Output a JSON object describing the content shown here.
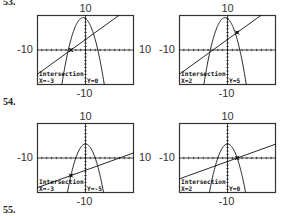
{
  "problems": {
    "top_label": "53.",
    "mid_label": "54.",
    "bottom_label": "55."
  },
  "window": {
    "xmin": -10,
    "xmax": 10,
    "ymin": -10,
    "ymax": 10,
    "labels": {
      "top": "10",
      "bottom": "-10",
      "left": "-10",
      "right": "10"
    }
  },
  "panels": [
    {
      "problem": "53",
      "curves": {
        "parabola": {
          "a": -1,
          "h": -0.5,
          "k": 9.25
        },
        "line": {
          "m": 1,
          "b": 3
        }
      },
      "intersection": {
        "x": -3,
        "y": 0
      },
      "readout": {
        "title": "Intersection",
        "x_text": "X=-3",
        "y_text": "Y=0"
      },
      "show_right_label": true
    },
    {
      "problem": "53",
      "curves": {
        "parabola": {
          "a": -1,
          "h": -0.5,
          "k": 9.25
        },
        "line": {
          "m": 1,
          "b": 3
        }
      },
      "intersection": {
        "x": 2,
        "y": 5
      },
      "readout": {
        "title": "Intersection",
        "x_text": "X=2",
        "y_text": "Y=5"
      },
      "show_right_label": false
    },
    {
      "problem": "54",
      "curves": {
        "parabola": {
          "a": -1,
          "h": 0,
          "k": 4
        },
        "line": {
          "m": 0.5,
          "b": -3.5
        }
      },
      "intersection": {
        "x": -3,
        "y": -5
      },
      "readout": {
        "title": "Intersection",
        "x_text": "X=-3",
        "y_text": "Y=-5"
      },
      "show_right_label": true
    },
    {
      "problem": "54",
      "curves": {
        "parabola": {
          "a": -1,
          "h": 0,
          "k": 4
        },
        "line": {
          "m": 0.5,
          "b": -1
        }
      },
      "intersection": {
        "x": 2,
        "y": 0
      },
      "readout": {
        "title": "Intersection",
        "x_text": "X=2",
        "y_text": "Y=0"
      },
      "show_right_label": false
    }
  ],
  "colors": {
    "ink": "#111111",
    "frame": "#333333"
  }
}
